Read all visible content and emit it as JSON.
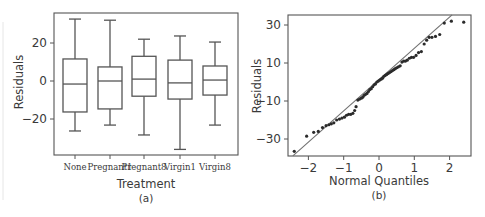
{
  "chart_data": [
    {
      "type": "boxplot",
      "panel_label": "(a)",
      "title": "",
      "xlabel": "Treatment",
      "ylabel": "Residuals",
      "categories": [
        "None",
        "Pregnant1",
        "Pregnant8",
        "Virgin1",
        "Virgin8"
      ],
      "yticks": [
        20,
        0,
        -20
      ],
      "ylim": [
        -40,
        36
      ],
      "grid": false,
      "boxes": [
        {
          "name": "None",
          "whisker_low": -26.3,
          "q1": -16.3,
          "median": -1.6,
          "q3": 11.6,
          "whisker_high": 32.6
        },
        {
          "name": "Pregnant1",
          "whisker_low": -23.2,
          "q1": -14.7,
          "median": 0.0,
          "q3": 7.4,
          "whisker_high": 32.0
        },
        {
          "name": "Pregnant8",
          "whisker_low": -28.4,
          "q1": -8.0,
          "median": 1.0,
          "q3": 13.0,
          "whisker_high": 22.0
        },
        {
          "name": "Virgin1",
          "whisker_low": -36.0,
          "q1": -9.5,
          "median": -1.0,
          "q3": 11.0,
          "whisker_high": 23.7
        },
        {
          "name": "Virgin8",
          "whisker_low": -23.2,
          "q1": -7.4,
          "median": 0.5,
          "q3": 7.9,
          "whisker_high": 20.5
        }
      ]
    },
    {
      "type": "scatter",
      "panel_label": "(b)",
      "title": "",
      "xlabel": "Normal Quantiles",
      "ylabel": "Residuals",
      "xticks": [
        -2,
        -1,
        0,
        1,
        2
      ],
      "yticks": [
        30,
        10,
        -10,
        -30
      ],
      "xlim": [
        -2.6,
        2.6
      ],
      "ylim": [
        -39,
        35
      ],
      "grid": false,
      "reference_line": {
        "x0": -2.44,
        "y0": -38.9,
        "x1": 2.07,
        "y1": 35.3
      },
      "points": {
        "x": [
          -2.4,
          -2.05,
          -1.85,
          -1.72,
          -1.6,
          -1.5,
          -1.42,
          -1.35,
          -1.28,
          -1.2,
          -1.12,
          -1.05,
          -0.98,
          -0.92,
          -0.86,
          -0.8,
          -0.74,
          -0.69,
          -0.65,
          -0.6,
          -0.55,
          -0.5,
          -0.46,
          -0.42,
          -0.38,
          -0.34,
          -0.3,
          -0.26,
          -0.22,
          -0.18,
          -0.14,
          -0.1,
          -0.06,
          -0.02,
          0.02,
          0.06,
          0.1,
          0.14,
          0.18,
          0.22,
          0.26,
          0.3,
          0.34,
          0.38,
          0.42,
          0.46,
          0.5,
          0.55,
          0.6,
          0.65,
          0.7,
          0.75,
          0.8,
          0.86,
          0.92,
          0.98,
          1.05,
          1.12,
          1.2,
          1.28,
          1.35,
          1.42,
          1.5,
          1.6,
          1.72,
          1.85,
          2.05,
          2.4
        ],
        "y": [
          -36.5,
          -28.5,
          -26.5,
          -26.0,
          -24.0,
          -23.0,
          -22.5,
          -22.0,
          -21.5,
          -20.0,
          -19.5,
          -19.0,
          -18.5,
          -17.5,
          -17.0,
          -17.0,
          -16.5,
          -15.0,
          -13.0,
          -9.5,
          -9.0,
          -8.5,
          -8.0,
          -7.0,
          -6.5,
          -6.0,
          -5.0,
          -4.0,
          -3.5,
          -2.5,
          -1.5,
          -1.0,
          0.0,
          0.5,
          1.0,
          1.5,
          2.0,
          3.0,
          3.5,
          4.0,
          4.5,
          5.0,
          5.5,
          6.0,
          6.5,
          7.0,
          7.5,
          8.0,
          8.5,
          10.5,
          11.0,
          11.0,
          11.5,
          12.5,
          13.0,
          13.0,
          14.0,
          15.5,
          16.0,
          20.0,
          22.0,
          23.5,
          23.5,
          24.0,
          25.0,
          31.0,
          32.0,
          31.5
        ]
      }
    }
  ],
  "panels": {
    "a": {
      "ylabel": "Residuals",
      "xlabel": "Treatment",
      "panel_label": "(a)",
      "yticks": [
        "20",
        "0",
        "−20"
      ],
      "categories": [
        "None",
        "Pregnant1",
        "Pregnant8",
        "Virgin1",
        "Virgin8"
      ]
    },
    "b": {
      "ylabel": "Residuals",
      "xlabel": "Normal Quantiles",
      "panel_label": "(b)",
      "yticks": [
        "30",
        "10",
        "−10",
        "−30"
      ],
      "xticks": [
        "−2",
        "−1",
        "0",
        "1",
        "2"
      ]
    }
  }
}
